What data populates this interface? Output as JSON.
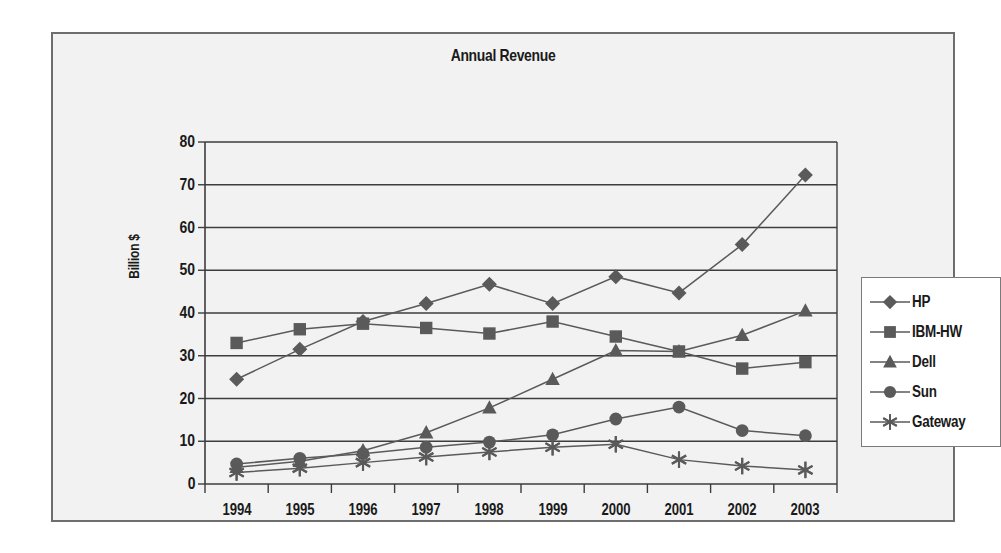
{
  "chart": {
    "title": "Annual Revenue",
    "ylabel": "Billion $",
    "ytick_labels": [
      "0",
      "10",
      "20",
      "30",
      "40",
      "50",
      "60",
      "70",
      "80"
    ]
  },
  "legend": {
    "items": [
      {
        "label": "HP",
        "marker": "diamond-marker",
        "color": "#5a5a5a"
      },
      {
        "label": "IBM-HW",
        "marker": "square-marker",
        "color": "#5a5a5a"
      },
      {
        "label": "Dell",
        "marker": "triangle-marker",
        "color": "#5a5a5a"
      },
      {
        "label": "Sun",
        "marker": "circle-marker",
        "color": "#5a5a5a"
      },
      {
        "label": "Gateway",
        "marker": "asterisk-marker",
        "color": "#5a5a5a"
      }
    ]
  },
  "chart_data": {
    "type": "line",
    "title": "Annual Revenue",
    "xlabel": "",
    "ylabel": "Billion $",
    "categories": [
      "1994",
      "1995",
      "1996",
      "1997",
      "1998",
      "1999",
      "2000",
      "2001",
      "2002",
      "2003"
    ],
    "ylim": [
      0,
      80
    ],
    "ytick_step": 10,
    "grid": true,
    "legend_position": "right",
    "series": [
      {
        "name": "HP",
        "marker": "diamond",
        "color": "#5a5a5a",
        "values": [
          24.5,
          31.5,
          38.0,
          42.2,
          46.7,
          42.2,
          48.5,
          44.7,
          56.0,
          72.3
        ]
      },
      {
        "name": "IBM-HW",
        "marker": "square",
        "color": "#5a5a5a",
        "values": [
          33.0,
          36.2,
          37.5,
          36.5,
          35.2,
          38.0,
          34.5,
          31.0,
          27.0,
          28.5
        ]
      },
      {
        "name": "Dell",
        "marker": "triangle",
        "color": "#5a5a5a",
        "values": [
          3.9,
          5.3,
          7.8,
          12.0,
          17.8,
          24.5,
          31.2,
          31.0,
          34.8,
          40.5
        ]
      },
      {
        "name": "Sun",
        "marker": "circle",
        "color": "#5a5a5a",
        "values": [
          4.7,
          6.0,
          7.1,
          8.6,
          9.8,
          11.5,
          15.2,
          18.0,
          12.5,
          11.3
        ]
      },
      {
        "name": "Gateway",
        "marker": "asterisk",
        "color": "#5a5a5a",
        "values": [
          2.7,
          3.7,
          5.0,
          6.3,
          7.5,
          8.6,
          9.3,
          5.7,
          4.2,
          3.3
        ]
      }
    ]
  }
}
